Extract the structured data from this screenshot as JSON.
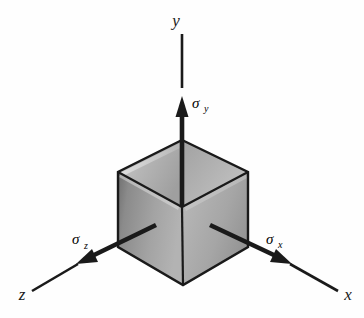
{
  "figure": {
    "background_color": "#fefefe",
    "line_color": "#1a1a1a",
    "axes": [
      {
        "name": "x-axis",
        "label": "x",
        "direction": "lower-right"
      },
      {
        "name": "y-axis",
        "label": "y",
        "direction": "up"
      },
      {
        "name": "z-axis",
        "label": "z",
        "direction": "lower-left"
      }
    ],
    "stresses": [
      {
        "name": "sigma-x",
        "symbol": "σ",
        "subscript": "x",
        "direction": "lower-right"
      },
      {
        "name": "sigma-y",
        "symbol": "σ",
        "subscript": "y",
        "direction": "up"
      },
      {
        "name": "sigma-z",
        "symbol": "σ",
        "subscript": "z",
        "direction": "lower-left"
      }
    ],
    "cube": {
      "face_top_left_color": "#b9b9b9",
      "face_top_right_color": "#a8a8a8",
      "face_left_color": "#9a9a9a",
      "face_right_color": "#b0b0b0",
      "edge_color": "#1a1a1a",
      "vertices": {
        "top_apex": [
          182,
          140
        ],
        "left_upper": [
          118,
          172
        ],
        "right_upper": [
          248,
          172
        ],
        "center": [
          182,
          207
        ],
        "left_lower": [
          118,
          247
        ],
        "right_lower": [
          248,
          247
        ],
        "bottom_apex": [
          183,
          285
        ]
      }
    }
  }
}
